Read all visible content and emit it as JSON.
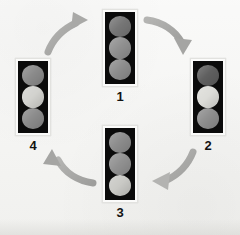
{
  "figure": {
    "type": "cycle-diagram",
    "background_color": "#f4f4f2",
    "palette": {
      "housing": "#0b0b0b",
      "frame": "#fbfbfa",
      "arrow": "#a8a8a6",
      "label_text": "#121212",
      "lamp_dark": "#6e6e6e",
      "lamp_mid": "#8f8f8f",
      "lamp_lit": "#d9d9d5"
    }
  },
  "signals": [
    {
      "label": "1",
      "position": "top",
      "x": 102,
      "y": 9,
      "width": 36,
      "height": 78,
      "lamps": [
        {
          "name": "top-lamp",
          "color": "#767676",
          "state": "dim"
        },
        {
          "name": "middle-lamp",
          "color": "#909090",
          "state": "dim"
        },
        {
          "name": "bottom-lamp",
          "color": "#8d8d8d",
          "state": "dim"
        }
      ]
    },
    {
      "label": "2",
      "position": "right",
      "x": 190,
      "y": 58,
      "width": 36,
      "height": 78,
      "lamps": [
        {
          "name": "top-lamp",
          "color": "#5f5f5f",
          "state": "dim"
        },
        {
          "name": "middle-lamp",
          "color": "#dcdcd8",
          "state": "lit"
        },
        {
          "name": "bottom-lamp",
          "color": "#8e8e8e",
          "state": "dim"
        }
      ]
    },
    {
      "label": "3",
      "position": "bottom",
      "x": 102,
      "y": 125,
      "width": 36,
      "height": 78,
      "lamps": [
        {
          "name": "top-lamp",
          "color": "#8c8c8c",
          "state": "dim"
        },
        {
          "name": "middle-lamp",
          "color": "#919191",
          "state": "dim"
        },
        {
          "name": "bottom-lamp",
          "color": "#c9c9c5",
          "state": "lit"
        }
      ]
    },
    {
      "label": "4",
      "position": "left",
      "x": 15,
      "y": 58,
      "width": 36,
      "height": 78,
      "lamps": [
        {
          "name": "top-lamp",
          "color": "#8a8a8a",
          "state": "dim"
        },
        {
          "name": "middle-lamp",
          "color": "#d2d2ce",
          "state": "lit"
        },
        {
          "name": "bottom-lamp",
          "color": "#8b8b8b",
          "state": "dim"
        }
      ]
    }
  ],
  "arrows": [
    {
      "name": "arrow-1-to-2",
      "from": "1",
      "to": "2",
      "direction": "down-right"
    },
    {
      "name": "arrow-2-to-3",
      "from": "2",
      "to": "3",
      "direction": "down-left"
    },
    {
      "name": "arrow-3-to-4",
      "from": "3",
      "to": "4",
      "direction": "up-left"
    },
    {
      "name": "arrow-4-to-1",
      "from": "4",
      "to": "1",
      "direction": "up-right"
    }
  ],
  "labels": {
    "one": "1",
    "two": "2",
    "three": "3",
    "four": "4"
  }
}
